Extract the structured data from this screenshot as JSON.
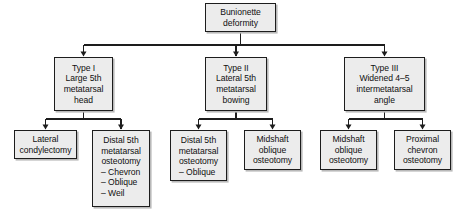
{
  "diagram": {
    "style": {
      "box_fill": "#ececec",
      "box_border": "#1d1d1d",
      "shadow": "#b9b9b9",
      "edge_color": "#1d1d1d",
      "background": "#ffffff"
    },
    "nodes": [
      {
        "id": "root",
        "name": "bunionette-deformity",
        "lines": [
          "Bunionette",
          "deformity"
        ],
        "x": 205,
        "y": 3,
        "w": 71,
        "h": 29
      },
      {
        "id": "type1",
        "name": "type-i",
        "lines": [
          "Type I",
          "Large 5th",
          "metatarsal",
          "head"
        ],
        "x": 54,
        "y": 57,
        "w": 59,
        "h": 54
      },
      {
        "id": "type2",
        "name": "type-ii",
        "lines": [
          "Type II",
          "Lateral 5th",
          "metatarsal",
          "bowing"
        ],
        "x": 205,
        "y": 57,
        "w": 62,
        "h": 54
      },
      {
        "id": "type3",
        "name": "type-iii",
        "lines": [
          "Type III",
          "Widened 4–5",
          "intermetatarsal",
          "angle"
        ],
        "x": 344,
        "y": 57,
        "w": 81,
        "h": 54
      },
      {
        "id": "t1a",
        "name": "lateral-condylectomy",
        "lines": [
          "Lateral",
          "condylectomy"
        ],
        "x": 14,
        "y": 130,
        "w": 63,
        "h": 29
      },
      {
        "id": "t1b",
        "name": "distal-5th-metatarsal-osteotomy-variants",
        "lines": [
          "Distal 5th",
          "metatarsal",
          "osteotomy"
        ],
        "bullets": [
          "– Chevron",
          "– Oblique",
          "– Weil"
        ],
        "x": 92,
        "y": 130,
        "w": 58,
        "h": 77
      },
      {
        "id": "t2a",
        "name": "distal-5th-metatarsal-osteotomy-oblique",
        "lines": [
          "Distal 5th",
          "metatarsal",
          "osteotomy"
        ],
        "bullets": [
          "– Oblique"
        ],
        "x": 170,
        "y": 130,
        "w": 57,
        "h": 51
      },
      {
        "id": "t2b",
        "name": "midshaft-oblique-osteotomy-type-ii",
        "lines": [
          "Midshaft",
          "oblique",
          "osteotomy"
        ],
        "x": 244,
        "y": 130,
        "w": 57,
        "h": 40
      },
      {
        "id": "t3a",
        "name": "midshaft-oblique-osteotomy-type-iii",
        "lines": [
          "Midshaft",
          "oblique",
          "osteotomy"
        ],
        "x": 320,
        "y": 130,
        "w": 57,
        "h": 40
      },
      {
        "id": "t3b",
        "name": "proximal-chevron-osteotomy",
        "lines": [
          "Proximal",
          "chevron",
          "osteotomy"
        ],
        "x": 394,
        "y": 130,
        "w": 57,
        "h": 40
      }
    ],
    "edges": [
      {
        "name": "root-to-types-bus",
        "from": "root",
        "to": [
          "type1",
          "type2",
          "type3"
        ],
        "bus_y": 45
      },
      {
        "name": "type1-to-children-bus",
        "from": "type1",
        "to": [
          "t1a",
          "t1b"
        ],
        "bus_y": 119
      },
      {
        "name": "type2-to-children-bus",
        "from": "type2",
        "to": [
          "t2a",
          "t2b"
        ],
        "bus_y": 119
      },
      {
        "name": "type3-to-children-bus",
        "from": "type3",
        "to": [
          "t3a",
          "t3b"
        ],
        "bus_y": 119
      }
    ]
  }
}
